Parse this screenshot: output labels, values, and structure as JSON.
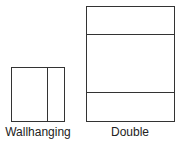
{
  "figures": [
    {
      "label": "Wallhanging"
    },
    {
      "label": "Double"
    }
  ]
}
